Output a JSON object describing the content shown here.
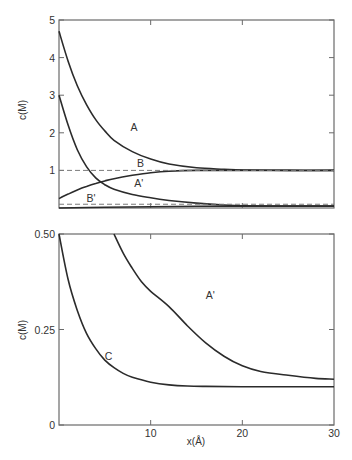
{
  "chart_data": [
    {
      "panel": "upper",
      "type": "line",
      "title": "",
      "xlabel": "x(Å)",
      "ylabel": "c(M)",
      "xlim": [
        0,
        30
      ],
      "ylim": [
        0,
        5
      ],
      "yticks": [
        "1",
        "2",
        "3",
        "4",
        "5"
      ],
      "xticks_marks": [
        10,
        20
      ],
      "grid": false,
      "legend": "inline curve labels",
      "series": [
        {
          "name": "A",
          "style": "solid",
          "x": [
            0,
            1,
            2,
            3,
            4,
            5,
            6,
            8,
            10,
            12,
            15,
            18,
            20,
            25,
            30
          ],
          "y": [
            4.7,
            3.9,
            3.25,
            2.75,
            2.35,
            2.05,
            1.8,
            1.5,
            1.3,
            1.17,
            1.07,
            1.03,
            1.01,
            1.0,
            1.0
          ]
        },
        {
          "name": "A'",
          "style": "solid",
          "x": [
            0,
            1,
            2,
            3,
            4,
            5,
            6,
            8,
            10,
            12,
            15,
            18,
            20,
            25,
            30
          ],
          "y": [
            3.0,
            2.2,
            1.55,
            1.1,
            0.8,
            0.62,
            0.5,
            0.36,
            0.27,
            0.2,
            0.13,
            0.08,
            0.06,
            0.05,
            0.05
          ]
        },
        {
          "name": "B",
          "style": "solid",
          "x": [
            0,
            1,
            2,
            3,
            4,
            5,
            6,
            8,
            10,
            12,
            15,
            20,
            25,
            30
          ],
          "y": [
            0.25,
            0.37,
            0.48,
            0.57,
            0.65,
            0.72,
            0.78,
            0.87,
            0.94,
            0.98,
            1.0,
            1.0,
            1.0,
            1.0
          ]
        },
        {
          "name": "B'",
          "style": "solid",
          "x": [
            0,
            5,
            10,
            15,
            20,
            25,
            30
          ],
          "y": [
            0.0,
            0.02,
            0.035,
            0.045,
            0.05,
            0.05,
            0.05
          ]
        },
        {
          "name": "reference 1 M",
          "style": "dashed",
          "x": [
            0,
            30
          ],
          "y": [
            1.0,
            1.0
          ]
        },
        {
          "name": "reference B'",
          "style": "dashed",
          "x": [
            0,
            30
          ],
          "y": [
            0.1,
            0.1
          ]
        }
      ],
      "annotations": [
        {
          "text": "A",
          "x": 7.8,
          "y": 2.05
        },
        {
          "text": "B",
          "x": 8.5,
          "y": 1.1
        },
        {
          "text": "A'",
          "x": 8.2,
          "y": 0.55
        },
        {
          "text": "B'",
          "x": 3.0,
          "y": 0.17
        }
      ]
    },
    {
      "panel": "lower",
      "type": "line",
      "title": "",
      "xlabel": "x(Å)",
      "ylabel": "c(M)",
      "xlim": [
        0,
        30
      ],
      "ylim": [
        0,
        0.5
      ],
      "yticks": [
        "0",
        "0.25",
        "0.50"
      ],
      "xticks": [
        "0",
        "10",
        "20",
        "30"
      ],
      "grid": false,
      "legend": "inline curve labels",
      "series": [
        {
          "name": "C",
          "style": "solid",
          "x": [
            0,
            1,
            2,
            3,
            4,
            5,
            6,
            7,
            8,
            10,
            12,
            14,
            16,
            20,
            25,
            30
          ],
          "y": [
            0.5,
            0.38,
            0.3,
            0.24,
            0.2,
            0.17,
            0.15,
            0.135,
            0.125,
            0.112,
            0.105,
            0.102,
            0.101,
            0.1,
            0.1,
            0.1
          ]
        },
        {
          "name": "A'",
          "style": "solid",
          "x": [
            6,
            7,
            8,
            9,
            10,
            12,
            14,
            16,
            18,
            20,
            22,
            25,
            28,
            30
          ],
          "y": [
            0.5,
            0.45,
            0.41,
            0.375,
            0.35,
            0.31,
            0.26,
            0.215,
            0.18,
            0.155,
            0.14,
            0.13,
            0.122,
            0.12
          ]
        }
      ],
      "annotations": [
        {
          "text": "C",
          "x": 5.0,
          "y": 0.17
        },
        {
          "text": "A'",
          "x": 16.0,
          "y": 0.33
        }
      ]
    }
  ],
  "labels": {
    "upper_ylabel": "c(M)",
    "lower_ylabel": "c(M)",
    "xlabel": "x(Å)",
    "upper_yticks": [
      "1",
      "2",
      "3",
      "4",
      "5"
    ],
    "lower_yticks": [
      "0",
      "0.25",
      "0.50"
    ],
    "xticks": [
      "0",
      "10",
      "20",
      "30"
    ],
    "curve_A": "A",
    "curve_A_prime": "A'",
    "curve_B": "B",
    "curve_B_prime": "B'",
    "curve_C": "C"
  }
}
